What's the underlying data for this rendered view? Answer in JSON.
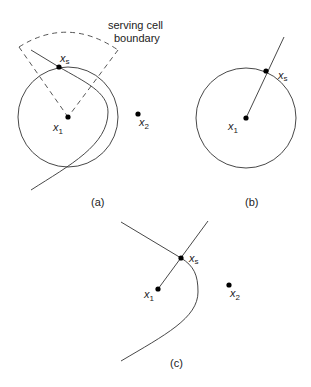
{
  "annotation": {
    "line1": "serving cell",
    "line2": "boundary"
  },
  "panels": [
    {
      "id": "a",
      "caption": "(a)",
      "points": {
        "x1": {
          "base": "x",
          "sub": "1"
        },
        "xs": {
          "base": "x",
          "sub": "s"
        },
        "x2": {
          "base": "x",
          "sub": "2"
        }
      }
    },
    {
      "id": "b",
      "caption": "(b)",
      "points": {
        "x1": {
          "base": "x",
          "sub": "1"
        },
        "xs": {
          "base": "x",
          "sub": "s"
        }
      }
    },
    {
      "id": "c",
      "caption": "(c)",
      "points": {
        "x1": {
          "base": "x",
          "sub": "1"
        },
        "xs": {
          "base": "x",
          "sub": "s"
        },
        "x2": {
          "base": "x",
          "sub": "2"
        }
      }
    }
  ],
  "colors": {
    "stroke": "#333333",
    "dot": "#000000"
  }
}
